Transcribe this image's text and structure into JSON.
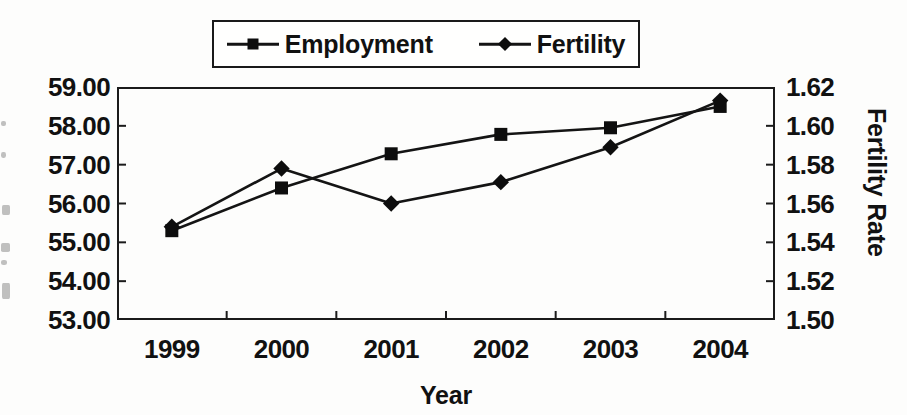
{
  "chart_data": {
    "type": "line",
    "title": "",
    "xlabel": "Year",
    "ylabel": "",
    "ylabel_right": "Fertility Rate",
    "categories": [
      "1999",
      "2000",
      "2001",
      "2002",
      "2003",
      "2004"
    ],
    "series": [
      {
        "name": "Employment",
        "axis": "left",
        "marker": "square",
        "values": [
          55.3,
          56.4,
          57.28,
          57.78,
          57.95,
          58.5
        ]
      },
      {
        "name": "Fertility",
        "axis": "right",
        "marker": "diamond",
        "values": [
          1.548,
          1.578,
          1.56,
          1.571,
          1.589,
          1.613
        ]
      }
    ],
    "ylim": [
      53.0,
      59.0
    ],
    "ylim_right": [
      1.5,
      1.62
    ],
    "ytick_labels": [
      "59.00",
      "58.00",
      "57.00",
      "56.00",
      "55.00",
      "54.00",
      "53.00"
    ],
    "ytick_values": [
      59.0,
      58.0,
      57.0,
      56.0,
      55.0,
      54.0,
      53.0
    ],
    "ytick_labels_right": [
      "1.62",
      "1.60",
      "1.58",
      "1.56",
      "1.54",
      "1.52",
      "1.50"
    ],
    "ytick_values_right": [
      1.62,
      1.6,
      1.58,
      1.56,
      1.54,
      1.52,
      1.5
    ],
    "grid": false,
    "legend_position": "top-center",
    "line_color": "#141414",
    "marker_color": "#0d0d0d",
    "frame_color": "#1b1b1b"
  },
  "legend": {
    "entries": [
      {
        "label": "Employment",
        "marker": "square"
      },
      {
        "label": "Fertility",
        "marker": "diamond"
      }
    ]
  },
  "axes": {
    "x_title": "Year",
    "y_right_title": "Fertility Rate"
  }
}
